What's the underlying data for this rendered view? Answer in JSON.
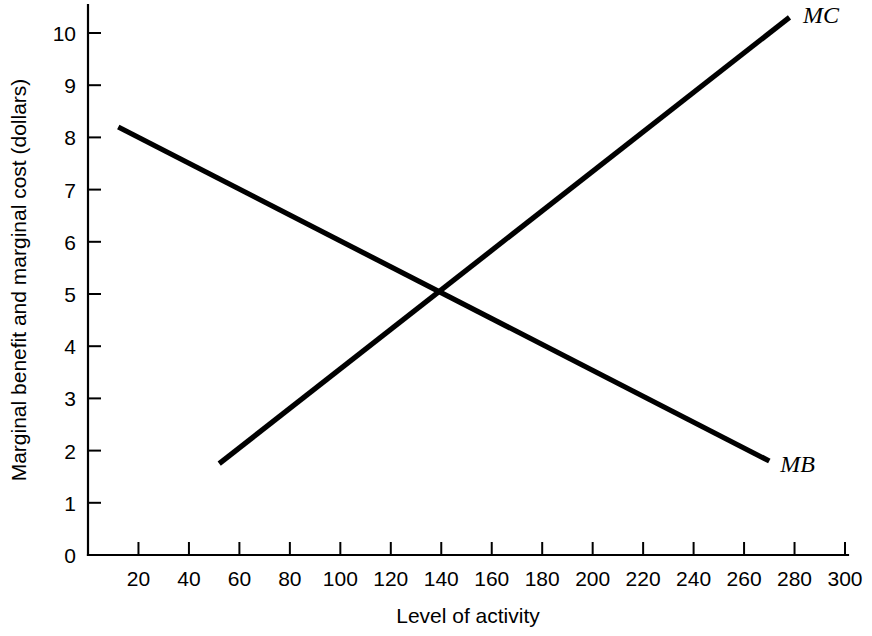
{
  "chart_data": {
    "type": "line",
    "title": "",
    "xlabel": "Level of activity",
    "ylabel": "Marginal benefit and marginal cost (dollars)",
    "xlim": [
      0,
      300
    ],
    "ylim": [
      0,
      10
    ],
    "xticks": [
      0,
      20,
      40,
      60,
      80,
      100,
      120,
      140,
      160,
      180,
      200,
      220,
      240,
      260,
      280,
      300
    ],
    "xtick_labels": [
      "0",
      "20",
      "40",
      "60",
      "80",
      "100",
      "120",
      "140",
      "160",
      "180",
      "200",
      "220",
      "240",
      "260",
      "280",
      "300"
    ],
    "yticks": [
      0,
      1,
      2,
      3,
      4,
      5,
      6,
      7,
      8,
      9,
      10
    ],
    "ytick_labels": [
      "0",
      "1",
      "2",
      "3",
      "4",
      "5",
      "6",
      "7",
      "8",
      "9",
      "10"
    ],
    "grid": false,
    "legend_position": "inline-end-of-line",
    "line_color": "#000000",
    "series": [
      {
        "name": "MB",
        "label": "MB",
        "x": [
          12,
          270
        ],
        "values": [
          8.2,
          1.8
        ],
        "label_x": 272,
        "label_y": 1.75
      },
      {
        "name": "MC",
        "label": "MC",
        "x": [
          52,
          278
        ],
        "values": [
          1.75,
          10.3
        ],
        "label_x": 281,
        "label_y": 10.35
      }
    ],
    "annotations": [
      {
        "name": "equilibrium",
        "x": 140,
        "y": 5,
        "text": ""
      }
    ]
  },
  "axes": {
    "x_axis_name": "Level of activity",
    "y_axis_name": "Marginal benefit and marginal cost (dollars)"
  }
}
